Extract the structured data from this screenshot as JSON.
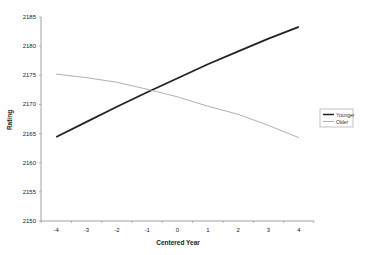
{
  "chart_data": {
    "type": "line",
    "title": "",
    "xlabel": "Centered Year",
    "ylabel": "Rating",
    "categories": [
      "-4",
      "-3",
      "-2",
      "-1",
      "0",
      "1",
      "2",
      "3",
      "4"
    ],
    "x": [
      -4,
      -3,
      -2,
      -1,
      0,
      1,
      2,
      3,
      4
    ],
    "series": [
      {
        "name": "Younger",
        "color": "#222222",
        "width": 1.8,
        "values": [
          2164.4,
          2167.0,
          2169.6,
          2172.1,
          2174.5,
          2176.9,
          2179.1,
          2181.3,
          2183.3
        ]
      },
      {
        "name": "Older",
        "color": "#9a9a9a",
        "width": 0.8,
        "values": [
          2175.2,
          2174.6,
          2173.8,
          2172.6,
          2171.3,
          2169.7,
          2168.3,
          2166.4,
          2164.3
        ]
      }
    ],
    "ylim": [
      2150,
      2185
    ],
    "yticks": [
      2150,
      2155,
      2160,
      2165,
      2170,
      2175,
      2180,
      2185
    ],
    "grid": false,
    "legend_position": "right"
  }
}
